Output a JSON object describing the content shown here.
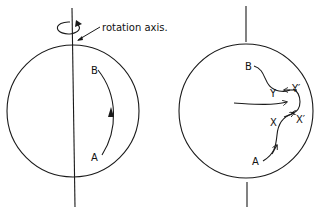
{
  "left_panel": {
    "callout": "rotation axis.",
    "labels": {
      "start": "A",
      "end": "B"
    }
  },
  "right_panel": {
    "labels": {
      "start": "A",
      "end": "B",
      "x": "X",
      "x_prime": "X′",
      "y": "Y",
      "y_prime": "Y′"
    }
  },
  "colors": {
    "ink": "#1a1a1a",
    "background": "#ffffff"
  }
}
